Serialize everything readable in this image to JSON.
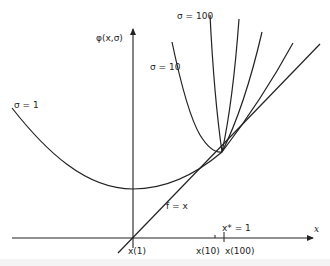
{
  "figure": {
    "y_axis_label": "φ(x,σ)",
    "x_axis_label": "x",
    "line_label": "f = x",
    "curve_labels": {
      "sigma_1": "σ = 1",
      "sigma_10": "σ = 10",
      "sigma_100": "σ = 100"
    },
    "x_ticks": {
      "x1": "x(1)",
      "x10": "x(10)",
      "x100": "x(100)",
      "xstar": "x* = 1"
    }
  },
  "colors": {
    "ink": "#222222",
    "background": "#ffffff"
  }
}
